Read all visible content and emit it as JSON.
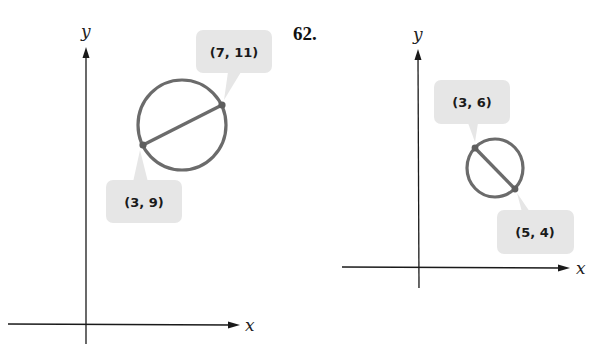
{
  "problem_number": "62.",
  "colors": {
    "axis": "#1a1a1a",
    "circle": "#6b6b6b",
    "callout_bg": "#e6e6e6"
  },
  "figures": [
    {
      "axes": {
        "x_label": "x",
        "y_label": "y"
      },
      "diameter_endpoints": [
        {
          "label": "(3, 9)",
          "x": 3,
          "y": 9
        },
        {
          "label": "(7, 11)",
          "x": 7,
          "y": 11
        }
      ]
    },
    {
      "axes": {
        "x_label": "x",
        "y_label": "y"
      },
      "diameter_endpoints": [
        {
          "label": "(3, 6)",
          "x": 3,
          "y": 6
        },
        {
          "label": "(5, 4)",
          "x": 5,
          "y": 4
        }
      ]
    }
  ]
}
